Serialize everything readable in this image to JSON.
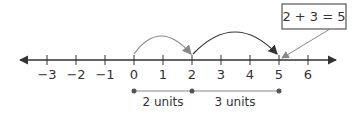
{
  "number_line": {
    "ticks": [
      {
        "value": -3,
        "label": "−3"
      },
      {
        "value": -2,
        "label": "−2"
      },
      {
        "value": -1,
        "label": "−1"
      },
      {
        "value": 0,
        "label": "0"
      },
      {
        "value": 1,
        "label": "1"
      },
      {
        "value": 2,
        "label": "2"
      },
      {
        "value": 3,
        "label": "3"
      },
      {
        "value": 4,
        "label": "4"
      },
      {
        "value": 5,
        "label": "5"
      },
      {
        "value": 6,
        "label": "6"
      }
    ]
  },
  "jumps": [
    {
      "from": 0,
      "to": 2
    },
    {
      "from": 2,
      "to": 5
    }
  ],
  "callout": {
    "text": "2 + 3 = 5"
  },
  "segments": [
    {
      "from": 0,
      "to": 2,
      "label": "2 units"
    },
    {
      "from": 2,
      "to": 5,
      "label": "3 units"
    }
  ],
  "colors": {
    "line": "#333333",
    "accent": "#888888"
  }
}
